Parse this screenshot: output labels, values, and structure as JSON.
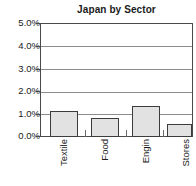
{
  "chart_data": {
    "type": "bar",
    "title": "Japan by Sector",
    "xlabel": "",
    "ylabel": "",
    "categories": [
      "Textile",
      "Food",
      "Engin",
      "Stores"
    ],
    "values": [
      1.15,
      0.85,
      1.35,
      0.55
    ],
    "ylim": [
      0.0,
      5.0
    ],
    "ytick_labels": [
      "5.0%",
      "4.0%",
      "3.0%",
      "2.0%",
      "1.0%",
      "0.0%"
    ],
    "ytick_values": [
      5.0,
      4.0,
      3.0,
      2.0,
      1.0,
      0.0
    ],
    "grid": true,
    "legend": "none",
    "value_unit": "%",
    "bar_fill_color": "#e2e2e2",
    "bar_border_color": "#3c3c3c",
    "gridline_color": "#8c8c8c",
    "axis_color": "#4a4a4a",
    "text_color": "#1a1a1a",
    "background_color": "#ffffff"
  }
}
